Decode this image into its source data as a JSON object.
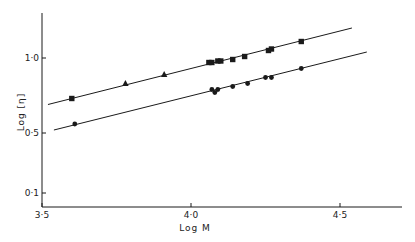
{
  "chart_data": {
    "type": "scatter",
    "title": "",
    "xlabel": "Log M",
    "ylabel": "Log [η]",
    "xlim": [
      3.5,
      4.7
    ],
    "ylim": [
      0.0,
      1.3
    ],
    "x_ticks": [
      {
        "value": 3.5,
        "label": "3·5"
      },
      {
        "value": 4.0,
        "label": "4·0"
      },
      {
        "value": 4.5,
        "label": "4·5"
      }
    ],
    "y_ticks": [
      {
        "value": 0.1,
        "label": "0·1"
      },
      {
        "value": 0.5,
        "label": "0·5"
      },
      {
        "value": 1.0,
        "label": "1·0"
      }
    ],
    "grid": false,
    "legend": null,
    "series": [
      {
        "name": "upper-squares",
        "marker": "square",
        "points": [
          [
            3.6,
            0.73
          ],
          [
            4.06,
            0.97
          ],
          [
            4.07,
            0.97
          ],
          [
            4.09,
            0.98
          ],
          [
            4.1,
            0.98
          ],
          [
            4.14,
            0.99
          ],
          [
            4.18,
            1.01
          ],
          [
            4.26,
            1.05
          ],
          [
            4.27,
            1.06
          ],
          [
            4.37,
            1.11
          ]
        ]
      },
      {
        "name": "upper-triangles",
        "marker": "triangle",
        "points": [
          [
            3.78,
            0.83
          ],
          [
            3.91,
            0.89
          ]
        ]
      },
      {
        "name": "lower-circles",
        "marker": "circle",
        "points": [
          [
            3.61,
            0.56
          ],
          [
            4.07,
            0.79
          ],
          [
            4.08,
            0.77
          ],
          [
            4.09,
            0.79
          ],
          [
            4.14,
            0.81
          ],
          [
            4.19,
            0.83
          ],
          [
            4.25,
            0.87
          ],
          [
            4.27,
            0.87
          ],
          [
            4.37,
            0.93
          ]
        ]
      }
    ],
    "fit_lines": [
      {
        "name": "upper-fit",
        "from": [
          3.52,
          0.69
        ],
        "to": [
          4.54,
          1.2
        ]
      },
      {
        "name": "lower-fit",
        "from": [
          3.54,
          0.52
        ],
        "to": [
          4.59,
          1.04
        ]
      }
    ]
  },
  "colors": {
    "ink": "#1a1a1a",
    "background": "#ffffff"
  }
}
